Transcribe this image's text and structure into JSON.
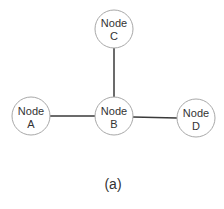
{
  "diagram": {
    "type": "graph",
    "nodes": [
      {
        "id": "A",
        "line1": "Node",
        "line2": "A"
      },
      {
        "id": "B",
        "line1": "Node",
        "line2": "B"
      },
      {
        "id": "C",
        "line1": "Node",
        "line2": "C"
      },
      {
        "id": "D",
        "line1": "Node",
        "line2": "D"
      }
    ],
    "edges": [
      {
        "from": "A",
        "to": "B"
      },
      {
        "from": "B",
        "to": "C"
      },
      {
        "from": "B",
        "to": "D"
      }
    ],
    "caption": "(a)"
  }
}
